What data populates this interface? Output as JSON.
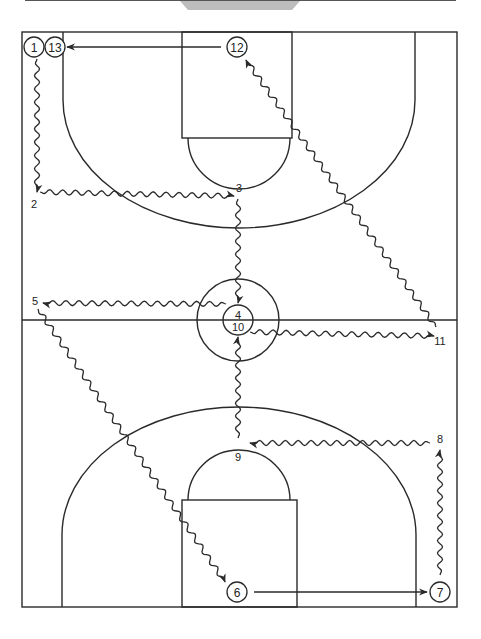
{
  "diagram": {
    "colors": {
      "line": "#2a2a2a",
      "background": "#ffffff",
      "header_bar": "#bdbdbd"
    },
    "court": {
      "x": 22,
      "y": 32,
      "width": 435,
      "height": 575,
      "midcourt_y": 320,
      "center_circle": {
        "cx": 238,
        "cy": 320,
        "r_outer": 41,
        "r_inner": 15
      }
    },
    "positions": [
      {
        "id": "1",
        "label": "1",
        "x": 34,
        "y": 47,
        "circled": true
      },
      {
        "id": "13",
        "label": "13",
        "x": 55,
        "y": 47,
        "circled": true
      },
      {
        "id": "12",
        "label": "12",
        "x": 237,
        "y": 47,
        "circled": true
      },
      {
        "id": "2",
        "label": "2",
        "x": 34,
        "y": 204,
        "circled": false
      },
      {
        "id": "3",
        "label": "3",
        "x": 239,
        "y": 188,
        "circled": false
      },
      {
        "id": "4",
        "label": "4",
        "x": 238,
        "y": 316,
        "circled": false
      },
      {
        "id": "10",
        "label": "10",
        "x": 238,
        "y": 330,
        "circled": false
      },
      {
        "id": "5",
        "label": "5",
        "x": 35,
        "y": 302,
        "circled": false
      },
      {
        "id": "11",
        "label": "11",
        "x": 440,
        "y": 345,
        "circled": false
      },
      {
        "id": "8",
        "label": "8",
        "x": 440,
        "y": 441,
        "circled": false
      },
      {
        "id": "9",
        "label": "9",
        "x": 238,
        "y": 459,
        "circled": false
      },
      {
        "id": "6",
        "label": "6",
        "x": 237,
        "y": 592,
        "circled": true
      },
      {
        "id": "7",
        "label": "7",
        "x": 440,
        "y": 592,
        "circled": true
      }
    ],
    "movements": [
      {
        "from": "1",
        "to": "2",
        "type": "dribble"
      },
      {
        "from": "2",
        "to": "3",
        "type": "dribble"
      },
      {
        "from": "3",
        "to": "4",
        "type": "dribble"
      },
      {
        "from": "4",
        "to": "5",
        "type": "dribble"
      },
      {
        "from": "5",
        "to": "6",
        "type": "dribble"
      },
      {
        "from": "6",
        "to": "7",
        "type": "pass"
      },
      {
        "from": "7",
        "to": "8",
        "type": "dribble"
      },
      {
        "from": "8",
        "to": "9",
        "type": "dribble"
      },
      {
        "from": "9",
        "to": "10",
        "type": "dribble"
      },
      {
        "from": "10",
        "to": "11",
        "type": "dribble"
      },
      {
        "from": "11",
        "to": "12",
        "type": "dribble"
      },
      {
        "from": "12",
        "to": "13",
        "type": "pass"
      }
    ]
  }
}
